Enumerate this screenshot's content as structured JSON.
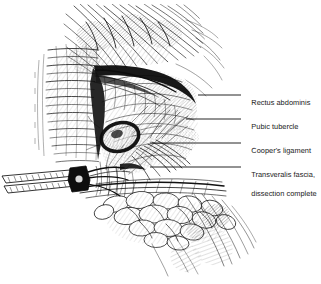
{
  "figure": {
    "kind": "anatomical-line-illustration",
    "technique": "pen-and-ink stipple and hatch drawing",
    "background_color": "#ffffff",
    "ink_color": "#101010",
    "width": 321,
    "height": 284
  },
  "labels": [
    {
      "id": "rectus-abdominis",
      "line1": "Rectus abdominis",
      "line2": "",
      "text_x": 243,
      "text_y": 89,
      "leader_y": 95,
      "leader_x_start": 198,
      "leader_x_end": 241
    },
    {
      "id": "pubic-tubercle",
      "line1": "Pubic tubercle",
      "line2": "",
      "text_x": 243,
      "text_y": 113,
      "leader_y": 119,
      "leader_x_start": 186,
      "leader_x_end": 241
    },
    {
      "id": "coopers-ligament",
      "line1": "Cooper's ligament",
      "line2": "",
      "text_x": 243,
      "text_y": 137,
      "leader_y": 143,
      "leader_x_start": 150,
      "leader_x_end": 241
    },
    {
      "id": "transveralis-fascia",
      "line1": "Transveralis fascia,",
      "line2": "dissection complete",
      "text_x": 243,
      "text_y": 161,
      "leader_y": 167,
      "leader_x_start": 150,
      "leader_x_end": 241
    }
  ],
  "structures": [
    {
      "id": "rectus-muscle-fibers",
      "name": "Rectus abdominis muscle fibers"
    },
    {
      "id": "striated-band",
      "name": "Striated aponeurotic band"
    },
    {
      "id": "dissection-shadow",
      "name": "Dark dissection shadow edge"
    },
    {
      "id": "pubic-tubercle-ring",
      "name": "Pubic tubercle bony prominence"
    },
    {
      "id": "coopers-ligament-fibers",
      "name": "Cooper's ligament fiber bundle"
    },
    {
      "id": "transversalis-fascia-field",
      "name": "Transversalis fascia field"
    },
    {
      "id": "adipose-tissue",
      "name": "Subcutaneous adipose tissue"
    },
    {
      "id": "surgical-retractor",
      "name": "Surgical retractor instrument"
    }
  ]
}
